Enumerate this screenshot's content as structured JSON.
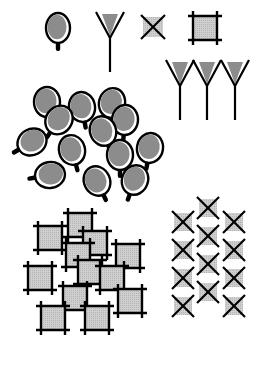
{
  "diagram": {
    "width": 267,
    "height": 365,
    "background": "#ffffff",
    "colors": {
      "stroke": "#000000",
      "fill_dark": "#8c8c8c",
      "fill_light": "#c8c8c8",
      "highlight": "#ffffff"
    },
    "legend": [
      {
        "name": "bead",
        "x": 60,
        "y": 30
      },
      {
        "name": "antibody",
        "x": 110,
        "y": 40
      },
      {
        "name": "x-square",
        "x": 153,
        "y": 27
      },
      {
        "name": "frame-square",
        "x": 205,
        "y": 28
      }
    ],
    "antibody_group": [
      {
        "x": 180,
        "y": 88
      },
      {
        "x": 207,
        "y": 88
      },
      {
        "x": 235,
        "y": 88
      }
    ],
    "bead_cluster": [
      {
        "x": 47,
        "y": 102,
        "rx": 13,
        "ry": 15
      },
      {
        "x": 82,
        "y": 107,
        "rx": 13,
        "ry": 15
      },
      {
        "x": 112,
        "y": 103,
        "rx": 13,
        "ry": 15
      },
      {
        "x": 125,
        "y": 120,
        "rx": 13,
        "ry": 15
      },
      {
        "x": 59,
        "y": 120,
        "rx": 13,
        "ry": 15
      },
      {
        "x": 103,
        "y": 131,
        "rx": 13,
        "ry": 15
      },
      {
        "x": 32,
        "y": 142,
        "rx": 13,
        "ry": 15
      },
      {
        "x": 72,
        "y": 150,
        "rx": 13,
        "ry": 15
      },
      {
        "x": 150,
        "y": 148,
        "rx": 13,
        "ry": 15
      },
      {
        "x": 120,
        "y": 155,
        "rx": 13,
        "ry": 15
      },
      {
        "x": 50,
        "y": 175,
        "rx": 13,
        "ry": 15
      },
      {
        "x": 97,
        "y": 181,
        "rx": 13,
        "ry": 15
      },
      {
        "x": 135,
        "y": 180,
        "rx": 13,
        "ry": 15
      }
    ],
    "frame_cluster": [
      {
        "x": 80,
        "y": 225
      },
      {
        "x": 50,
        "y": 238
      },
      {
        "x": 95,
        "y": 243
      },
      {
        "x": 78,
        "y": 255
      },
      {
        "x": 128,
        "y": 256
      },
      {
        "x": 40,
        "y": 278
      },
      {
        "x": 90,
        "y": 272
      },
      {
        "x": 112,
        "y": 278
      },
      {
        "x": 75,
        "y": 298
      },
      {
        "x": 130,
        "y": 301
      },
      {
        "x": 53,
        "y": 318
      },
      {
        "x": 97,
        "y": 318
      }
    ],
    "x_grid": {
      "columns": [
        {
          "x": 183,
          "rows_y": [
            222,
            250,
            278,
            306
          ]
        },
        {
          "x": 208,
          "rows_y": [
            208,
            236,
            264,
            292
          ]
        },
        {
          "x": 234,
          "rows_y": [
            222,
            250,
            278,
            306
          ]
        }
      ],
      "size": 22
    }
  }
}
